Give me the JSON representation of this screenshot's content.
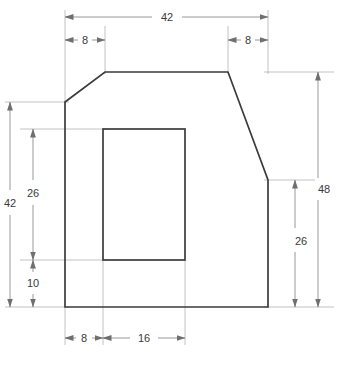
{
  "drawing": {
    "title": "Orthographic part outline with rectangular cutout",
    "units": "mm",
    "line_color": "#3b3b3b",
    "dim_color": "#9a9a9a",
    "text_color": "#3a3a3a",
    "background": "#ffffff",
    "outline_points": "65,102 105,72 228,72 268,180 268,307 65,307",
    "cutout_rect": {
      "x": 103,
      "y": 129,
      "width": 82,
      "height": 131
    }
  },
  "dimensions": {
    "overall_width": {
      "label": "42",
      "value": 42
    },
    "top_left_chamfer": {
      "label": "8",
      "value": 8
    },
    "top_right_chamfer": {
      "label": "8",
      "value": 8
    },
    "left_overall_height": {
      "label": "42",
      "value": 42
    },
    "left_upper": {
      "label": "26",
      "value": 26
    },
    "left_lower": {
      "label": "10",
      "value": 10
    },
    "right_overall_height": {
      "label": "48",
      "value": 48
    },
    "right_lower": {
      "label": "26",
      "value": 26
    },
    "bottom_offset": {
      "label": "8",
      "value": 8
    },
    "cutout_width": {
      "label": "16",
      "value": 16
    }
  }
}
